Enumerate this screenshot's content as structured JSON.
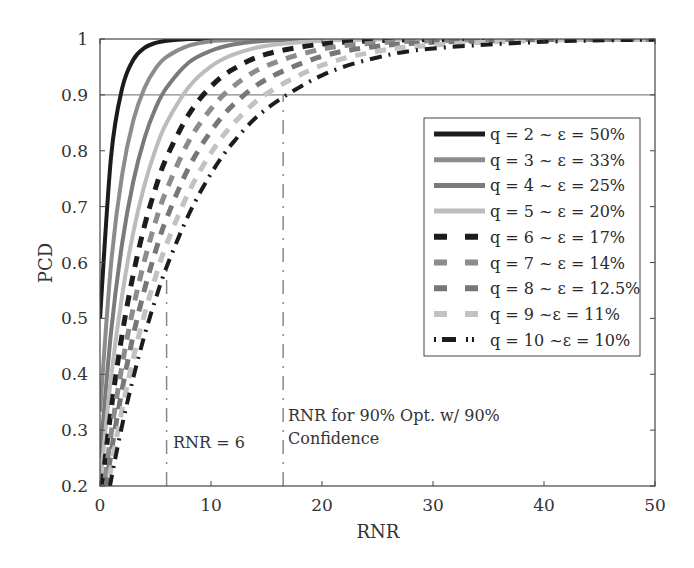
{
  "chart_data": {
    "type": "line",
    "title": "",
    "xlabel": "RNR",
    "ylabel": "PCD",
    "xlim": [
      0,
      50
    ],
    "ylim": [
      0.2,
      1
    ],
    "xticks": [
      0,
      10,
      20,
      30,
      40,
      50
    ],
    "yticks": [
      0.2,
      0.3,
      0.4,
      0.5,
      0.6,
      0.7,
      0.8,
      0.9,
      1
    ],
    "ytick_labels": [
      "0.2",
      "0.3",
      "0.4",
      "0.5",
      "0.6",
      "0.7",
      "0.8",
      "0.9",
      "1"
    ],
    "grid": false,
    "legend_position": "right-center (inside plot)",
    "x": [
      0,
      1,
      2,
      3,
      4,
      5,
      6,
      8,
      10,
      12,
      15,
      20,
      25,
      30,
      40,
      50
    ],
    "series": [
      {
        "name": "q = 2 ~ ε = 50%",
        "color": "#1c1c1c",
        "style": "solid",
        "width": 4,
        "values": [
          0.5,
          0.79,
          0.912,
          0.963,
          0.984,
          0.993,
          0.997,
          1,
          1,
          1,
          1,
          1,
          1,
          1,
          1,
          1
        ]
      },
      {
        "name": "q = 3 ~ ε = 33%",
        "color": "#8c8c8c",
        "style": "solid",
        "width": 4,
        "values": [
          0.333,
          0.598,
          0.758,
          0.854,
          0.912,
          0.947,
          0.968,
          0.988,
          0.996,
          0.998,
          1,
          1,
          1,
          1,
          1,
          1
        ]
      },
      {
        "name": "q = 4 ~ ε = 25%",
        "color": "#7a7a7a",
        "style": "solid",
        "width": 4,
        "values": [
          0.25,
          0.476,
          0.635,
          0.745,
          0.822,
          0.876,
          0.913,
          0.958,
          0.979,
          0.99,
          0.997,
          0.999,
          1,
          1,
          1,
          1
        ]
      },
      {
        "name": "q = 5 ~ ε = 20%",
        "color": "#bcbcbc",
        "style": "solid",
        "width": 4,
        "values": [
          0.2,
          0.395,
          0.542,
          0.654,
          0.738,
          0.802,
          0.85,
          0.914,
          0.951,
          0.972,
          0.988,
          0.997,
          0.999,
          1,
          1,
          1
        ]
      },
      {
        "name": "q = 6 ~ ε = 17%",
        "color": "#1c1c1c",
        "style": "dash",
        "width": 5,
        "values": [
          0.167,
          0.336,
          0.472,
          0.579,
          0.665,
          0.733,
          0.788,
          0.865,
          0.915,
          0.946,
          0.973,
          0.991,
          0.997,
          0.999,
          1,
          1
        ]
      },
      {
        "name": "q = 7 ~ ε = 14%",
        "color": "#8c8c8c",
        "style": "dash",
        "width": 5,
        "values": [
          0.143,
          0.293,
          0.417,
          0.519,
          0.603,
          0.673,
          0.73,
          0.817,
          0.875,
          0.915,
          0.952,
          0.982,
          0.993,
          0.997,
          1,
          1
        ]
      },
      {
        "name": "q = 8 ~ ε = 12.5%",
        "color": "#777777",
        "style": "dash",
        "width": 5,
        "values": [
          0.125,
          0.259,
          0.373,
          0.47,
          0.551,
          0.62,
          0.679,
          0.77,
          0.835,
          0.882,
          0.928,
          0.969,
          0.987,
          0.994,
          0.999,
          1
        ]
      },
      {
        "name": "q = 9 ~ε = 11%",
        "color": "#c2c2c2",
        "style": "dash",
        "width": 5,
        "values": [
          0.111,
          0.233,
          0.338,
          0.429,
          0.507,
          0.574,
          0.633,
          0.726,
          0.796,
          0.848,
          0.902,
          0.953,
          0.978,
          0.989,
          0.998,
          0.999
        ]
      },
      {
        "name": "q = 10 ~ε = 10%",
        "color": "#1c1c1c",
        "style": "dashdot",
        "width": 4,
        "values": [
          0.1,
          0.211,
          0.309,
          0.394,
          0.469,
          0.534,
          0.592,
          0.686,
          0.759,
          0.815,
          0.875,
          0.935,
          0.967,
          0.983,
          0.995,
          0.999
        ]
      }
    ],
    "reference_lines": [
      {
        "type": "horizontal",
        "y": 0.9,
        "color": "#888888",
        "style": "solid"
      },
      {
        "type": "vertical",
        "x": 6,
        "y_from": 0.2,
        "y_to": 0.6,
        "color": "#888888",
        "style": "dashdot"
      },
      {
        "type": "vertical",
        "x": 16.5,
        "y_from": 0.2,
        "y_to": 0.9,
        "color": "#888888",
        "style": "dashdot"
      }
    ],
    "annotations": [
      {
        "text": "RNR = 6",
        "x": 6.5,
        "y": 0.245
      },
      {
        "text_line1": "RNR for 90% Opt. w/ 90%",
        "text_line2": "Confidence",
        "x": 17,
        "y": 0.3
      }
    ]
  }
}
